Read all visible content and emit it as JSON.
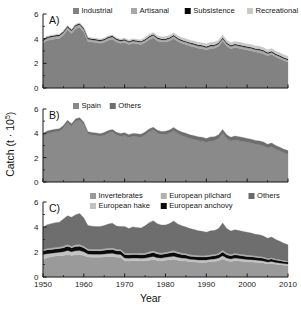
{
  "figure": {
    "y_axis_title_main": "Catch (t ",
    "y_axis_title_mult": "· 10",
    "y_axis_title_exp": "5",
    "y_axis_title_close": ")",
    "x_axis_title": "Year",
    "y_ticks": [
      "0",
      "2",
      "4",
      "6"
    ],
    "x_ticks": [
      "1950",
      "1960",
      "1970",
      "1980",
      "1990",
      "2000",
      "2010"
    ]
  },
  "colors": {
    "industrial": "#828282",
    "artisanal": "#a8a8a8",
    "subsistence": "#0a0a0a",
    "recreational": "#c9c9c9",
    "spain": "#8a8a8a",
    "others_country": "#6e6e6e",
    "invertebrates": "#9a9a9a",
    "european_hake": "#c2c2c2",
    "european_anchovy": "#0a0a0a",
    "european_pilchard": "#b0b0b0",
    "others_taxon": "#6b6b6b",
    "axis": "#1a1a1a",
    "background": "#ffffff"
  },
  "panels": [
    {
      "id": "A",
      "label": "A)",
      "legend": [
        {
          "name": "Industrial",
          "swatch": "industrial"
        },
        {
          "name": "Artisanal",
          "swatch": "artisanal"
        },
        {
          "name": "Subsistence",
          "swatch": "subsistence"
        },
        {
          "name": "Recreational",
          "swatch": "recreational"
        }
      ]
    },
    {
      "id": "B",
      "label": "B)",
      "legend": [
        {
          "name": "Spain",
          "swatch": "spain"
        },
        {
          "name": "Others",
          "swatch": "others_country"
        }
      ]
    },
    {
      "id": "C",
      "label": "C)",
      "legend": [
        {
          "name": "Invertebrates",
          "swatch": "invertebrates"
        },
        {
          "name": "European pilchard",
          "swatch": "european_pilchard"
        },
        {
          "name": "Others",
          "swatch": "others_taxon"
        },
        {
          "name": "European hake",
          "swatch": "european_hake"
        },
        {
          "name": "European anchovy",
          "swatch": "european_anchovy"
        }
      ]
    }
  ],
  "chart_data": [
    {
      "type": "area",
      "panel": "A",
      "title": "A) Catch by fishing sector",
      "xlabel": "Year",
      "ylabel": "Catch (t · 10^5)",
      "xlim": [
        1950,
        2010
      ],
      "ylim": [
        0,
        6
      ],
      "stacked": true,
      "grid": false,
      "legend_position": "top",
      "x": [
        1950,
        1951,
        1952,
        1953,
        1954,
        1955,
        1956,
        1957,
        1958,
        1959,
        1960,
        1961,
        1962,
        1963,
        1964,
        1965,
        1966,
        1967,
        1968,
        1969,
        1970,
        1971,
        1972,
        1973,
        1974,
        1975,
        1976,
        1977,
        1978,
        1979,
        1980,
        1981,
        1982,
        1983,
        1984,
        1985,
        1986,
        1987,
        1988,
        1989,
        1990,
        1991,
        1992,
        1993,
        1994,
        1995,
        1996,
        1997,
        1998,
        1999,
        2000,
        2001,
        2002,
        2003,
        2004,
        2005,
        2006,
        2007,
        2008,
        2009,
        2010
      ],
      "series": [
        {
          "name": "Industrial",
          "values": [
            3.62,
            3.85,
            3.92,
            3.98,
            4.02,
            4.28,
            4.72,
            4.42,
            4.82,
            4.92,
            4.55,
            3.78,
            3.72,
            3.68,
            3.62,
            3.7,
            3.88,
            3.95,
            3.72,
            3.62,
            3.68,
            3.52,
            3.62,
            3.58,
            3.52,
            3.68,
            3.92,
            4.08,
            3.82,
            3.72,
            3.72,
            3.82,
            4.02,
            3.78,
            3.62,
            3.52,
            3.4,
            3.32,
            3.22,
            3.18,
            3.08,
            3.2,
            3.22,
            3.38,
            3.82,
            3.38,
            3.18,
            3.28,
            3.22,
            3.15,
            3.08,
            3.02,
            2.92,
            2.88,
            2.78,
            2.62,
            2.72,
            2.52,
            2.38,
            2.22,
            2.1
          ]
        },
        {
          "name": "Artisanal",
          "values": [
            0.22,
            0.22,
            0.22,
            0.22,
            0.22,
            0.22,
            0.22,
            0.22,
            0.22,
            0.22,
            0.22,
            0.2,
            0.2,
            0.2,
            0.2,
            0.2,
            0.2,
            0.2,
            0.2,
            0.2,
            0.2,
            0.2,
            0.2,
            0.2,
            0.2,
            0.2,
            0.2,
            0.2,
            0.2,
            0.2,
            0.2,
            0.2,
            0.2,
            0.2,
            0.2,
            0.2,
            0.2,
            0.2,
            0.2,
            0.2,
            0.2,
            0.2,
            0.2,
            0.2,
            0.2,
            0.2,
            0.2,
            0.2,
            0.2,
            0.2,
            0.2,
            0.2,
            0.2,
            0.2,
            0.2,
            0.18,
            0.18,
            0.18,
            0.18,
            0.18,
            0.18
          ]
        },
        {
          "name": "Subsistence",
          "values": [
            0.08,
            0.08,
            0.08,
            0.08,
            0.08,
            0.08,
            0.08,
            0.08,
            0.08,
            0.08,
            0.08,
            0.08,
            0.08,
            0.08,
            0.08,
            0.08,
            0.08,
            0.08,
            0.08,
            0.08,
            0.08,
            0.08,
            0.08,
            0.08,
            0.08,
            0.08,
            0.08,
            0.08,
            0.08,
            0.08,
            0.08,
            0.08,
            0.08,
            0.08,
            0.08,
            0.08,
            0.08,
            0.08,
            0.08,
            0.08,
            0.08,
            0.08,
            0.08,
            0.08,
            0.08,
            0.08,
            0.08,
            0.08,
            0.08,
            0.08,
            0.08,
            0.08,
            0.08,
            0.08,
            0.08,
            0.08,
            0.08,
            0.08,
            0.08,
            0.08,
            0.08
          ]
        },
        {
          "name": "Recreational",
          "values": [
            0.05,
            0.05,
            0.05,
            0.06,
            0.06,
            0.06,
            0.06,
            0.06,
            0.07,
            0.07,
            0.07,
            0.07,
            0.07,
            0.07,
            0.07,
            0.08,
            0.08,
            0.08,
            0.08,
            0.08,
            0.09,
            0.09,
            0.09,
            0.1,
            0.12,
            0.14,
            0.15,
            0.15,
            0.16,
            0.16,
            0.17,
            0.18,
            0.18,
            0.19,
            0.2,
            0.2,
            0.2,
            0.21,
            0.21,
            0.21,
            0.22,
            0.22,
            0.22,
            0.22,
            0.22,
            0.22,
            0.22,
            0.22,
            0.22,
            0.22,
            0.22,
            0.22,
            0.22,
            0.22,
            0.22,
            0.22,
            0.22,
            0.22,
            0.22,
            0.22,
            0.22
          ]
        }
      ]
    },
    {
      "type": "area",
      "panel": "B",
      "title": "B) Catch by fishing country",
      "xlabel": "Year",
      "ylabel": "Catch (t · 10^5)",
      "xlim": [
        1950,
        2010
      ],
      "ylim": [
        0,
        6
      ],
      "stacked": true,
      "grid": false,
      "legend_position": "top",
      "x": [
        1950,
        1951,
        1952,
        1953,
        1954,
        1955,
        1956,
        1957,
        1958,
        1959,
        1960,
        1961,
        1962,
        1963,
        1964,
        1965,
        1966,
        1967,
        1968,
        1969,
        1970,
        1971,
        1972,
        1973,
        1974,
        1975,
        1976,
        1977,
        1978,
        1979,
        1980,
        1981,
        1982,
        1983,
        1984,
        1985,
        1986,
        1987,
        1988,
        1989,
        1990,
        1991,
        1992,
        1993,
        1994,
        1995,
        1996,
        1997,
        1998,
        1999,
        2000,
        2001,
        2002,
        2003,
        2004,
        2005,
        2006,
        2007,
        2008,
        2009,
        2010
      ],
      "series": [
        {
          "name": "Spain",
          "values": [
            3.72,
            3.98,
            4.05,
            4.12,
            4.16,
            4.42,
            4.9,
            4.58,
            5.0,
            5.1,
            4.72,
            3.92,
            3.86,
            3.82,
            3.76,
            3.84,
            4.02,
            4.1,
            3.86,
            3.76,
            3.82,
            3.66,
            3.76,
            3.72,
            3.68,
            3.86,
            4.12,
            4.28,
            4.0,
            3.9,
            3.9,
            4.0,
            4.22,
            3.98,
            3.8,
            3.7,
            3.58,
            3.5,
            3.4,
            3.36,
            3.26,
            3.38,
            3.4,
            3.56,
            4.02,
            3.56,
            3.36,
            3.46,
            3.4,
            3.32,
            3.26,
            3.2,
            3.1,
            3.06,
            2.96,
            2.8,
            2.9,
            2.7,
            2.56,
            2.4,
            2.28
          ]
        },
        {
          "name": "Others",
          "values": [
            0.25,
            0.22,
            0.22,
            0.22,
            0.22,
            0.22,
            0.18,
            0.2,
            0.19,
            0.19,
            0.2,
            0.21,
            0.21,
            0.21,
            0.21,
            0.22,
            0.22,
            0.21,
            0.22,
            0.22,
            0.23,
            0.23,
            0.23,
            0.24,
            0.24,
            0.24,
            0.23,
            0.23,
            0.26,
            0.26,
            0.27,
            0.28,
            0.26,
            0.27,
            0.3,
            0.3,
            0.3,
            0.31,
            0.31,
            0.31,
            0.32,
            0.32,
            0.32,
            0.32,
            0.3,
            0.32,
            0.32,
            0.32,
            0.32,
            0.33,
            0.32,
            0.32,
            0.32,
            0.32,
            0.32,
            0.3,
            0.3,
            0.3,
            0.3,
            0.3,
            0.3
          ]
        }
      ]
    },
    {
      "type": "area",
      "panel": "C",
      "title": "C) Catch by taxon",
      "xlabel": "Year",
      "ylabel": "Catch (t · 10^5)",
      "xlim": [
        1950,
        2010
      ],
      "ylim": [
        0,
        6
      ],
      "stacked": true,
      "grid": false,
      "legend_position": "top",
      "x": [
        1950,
        1951,
        1952,
        1953,
        1954,
        1955,
        1956,
        1957,
        1958,
        1959,
        1960,
        1961,
        1962,
        1963,
        1964,
        1965,
        1966,
        1967,
        1968,
        1969,
        1970,
        1971,
        1972,
        1973,
        1974,
        1975,
        1976,
        1977,
        1978,
        1979,
        1980,
        1981,
        1982,
        1983,
        1984,
        1985,
        1986,
        1987,
        1988,
        1989,
        1990,
        1991,
        1992,
        1993,
        1994,
        1995,
        1996,
        1997,
        1998,
        1999,
        2000,
        2001,
        2002,
        2003,
        2004,
        2005,
        2006,
        2007,
        2008,
        2009,
        2010
      ],
      "series": [
        {
          "name": "Invertebrates",
          "values": [
            1.38,
            1.55,
            1.62,
            1.68,
            1.7,
            1.72,
            1.8,
            1.72,
            1.78,
            1.8,
            1.72,
            1.6,
            1.58,
            1.58,
            1.58,
            1.6,
            1.62,
            1.64,
            1.58,
            1.56,
            1.3,
            1.28,
            1.3,
            1.3,
            1.28,
            1.3,
            1.35,
            1.4,
            1.32,
            1.3,
            1.35,
            1.38,
            1.42,
            1.35,
            1.3,
            1.28,
            1.22,
            1.2,
            1.18,
            1.17,
            1.18,
            1.22,
            1.25,
            1.3,
            1.45,
            1.3,
            1.25,
            1.3,
            1.28,
            1.25,
            1.22,
            1.2,
            1.18,
            1.15,
            1.12,
            1.05,
            1.08,
            1.02,
            0.98,
            0.95,
            0.92
          ]
        },
        {
          "name": "European hake",
          "values": [
            0.42,
            0.32,
            0.28,
            0.26,
            0.28,
            0.3,
            0.32,
            0.3,
            0.32,
            0.32,
            0.3,
            0.25,
            0.25,
            0.25,
            0.24,
            0.25,
            0.26,
            0.26,
            0.25,
            0.24,
            0.22,
            0.22,
            0.22,
            0.22,
            0.22,
            0.22,
            0.24,
            0.25,
            0.23,
            0.22,
            0.23,
            0.24,
            0.25,
            0.23,
            0.22,
            0.22,
            0.2,
            0.2,
            0.19,
            0.19,
            0.19,
            0.2,
            0.2,
            0.22,
            0.25,
            0.22,
            0.2,
            0.22,
            0.21,
            0.2,
            0.19,
            0.19,
            0.18,
            0.18,
            0.17,
            0.15,
            0.16,
            0.15,
            0.14,
            0.13,
            0.12
          ]
        },
        {
          "name": "European anchovy",
          "values": [
            0.3,
            0.3,
            0.3,
            0.3,
            0.3,
            0.32,
            0.35,
            0.32,
            0.35,
            0.35,
            0.32,
            0.28,
            0.28,
            0.28,
            0.28,
            0.3,
            0.3,
            0.3,
            0.28,
            0.28,
            0.28,
            0.28,
            0.28,
            0.28,
            0.28,
            0.28,
            0.3,
            0.32,
            0.3,
            0.28,
            0.28,
            0.3,
            0.32,
            0.3,
            0.28,
            0.27,
            0.25,
            0.25,
            0.24,
            0.24,
            0.24,
            0.25,
            0.25,
            0.26,
            0.3,
            0.26,
            0.25,
            0.26,
            0.25,
            0.24,
            0.24,
            0.23,
            0.22,
            0.22,
            0.21,
            0.2,
            0.21,
            0.19,
            0.18,
            0.17,
            0.16
          ]
        },
        {
          "name": "European pilchard",
          "values": [
            0.1,
            0.12,
            0.12,
            0.12,
            0.12,
            0.12,
            0.14,
            0.13,
            0.14,
            0.14,
            0.13,
            0.12,
            0.12,
            0.12,
            0.12,
            0.12,
            0.13,
            0.13,
            0.12,
            0.12,
            0.12,
            0.12,
            0.12,
            0.12,
            0.12,
            0.12,
            0.13,
            0.14,
            0.13,
            0.12,
            0.13,
            0.13,
            0.14,
            0.13,
            0.12,
            0.12,
            0.11,
            0.11,
            0.11,
            0.11,
            0.11,
            0.11,
            0.11,
            0.12,
            0.14,
            0.12,
            0.11,
            0.12,
            0.11,
            0.11,
            0.11,
            0.1,
            0.1,
            0.1,
            0.1,
            0.09,
            0.1,
            0.09,
            0.08,
            0.08,
            0.07
          ]
        },
        {
          "name": "Others",
          "values": [
            1.77,
            1.89,
            1.95,
            1.98,
            1.98,
            2.18,
            2.29,
            2.31,
            2.4,
            2.48,
            2.25,
            1.88,
            1.84,
            1.81,
            1.82,
            1.85,
            1.93,
            1.97,
            1.85,
            1.84,
            2.13,
            1.99,
            2.09,
            2.04,
            2.02,
            2.18,
            2.33,
            2.4,
            2.28,
            2.24,
            2.18,
            2.23,
            2.35,
            2.24,
            2.18,
            2.11,
            2.1,
            2.05,
            1.99,
            1.96,
            1.86,
            1.92,
            1.91,
            1.98,
            2.18,
            1.98,
            1.87,
            1.88,
            1.87,
            1.85,
            1.82,
            1.8,
            1.74,
            1.73,
            1.68,
            1.61,
            1.65,
            1.55,
            1.48,
            1.37,
            1.31
          ]
        }
      ]
    }
  ]
}
